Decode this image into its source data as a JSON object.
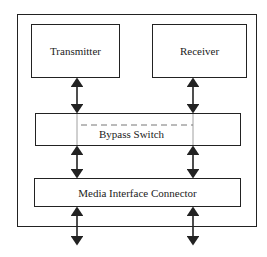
{
  "diagram": {
    "outer_label": "",
    "blocks": {
      "transmitter": "Transmitter",
      "receiver": "Receiver",
      "bypass_switch": "Bypass Switch",
      "media_interface_connector": "Media Interface Connector"
    },
    "colors": {
      "line": "#222222",
      "dashed": "#777777",
      "background": "#ffffff"
    }
  }
}
